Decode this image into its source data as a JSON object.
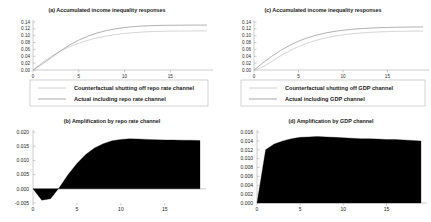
{
  "figure": {
    "background": "#ffffff",
    "line_color_counterfactual": "#d0d0d0",
    "line_color_actual": "#a8a8a8",
    "fill_color": "#000000"
  },
  "panels": {
    "a": {
      "title": "(a) Accumulated income inequality responses",
      "legend": {
        "counterfactual": "Counterfactual shutting off repo rate channel",
        "actual": "Actual including repo rate channel"
      }
    },
    "b": {
      "title": "(b) Amplification by repo rate channel"
    },
    "c": {
      "title": "(c) Accumulated income inequality responses",
      "legend": {
        "counterfactual": "Counterfactual shutting off GDP channel",
        "actual": "Actual including GDP channel"
      }
    },
    "d": {
      "title": "(d) Amplification by GDP channel"
    }
  },
  "chart_data": [
    {
      "id": "a",
      "type": "line",
      "title": "(a) Accumulated income inequality responses",
      "xlabel": "",
      "ylabel": "",
      "xlim": [
        0,
        19
      ],
      "ylim": [
        0.0,
        0.14
      ],
      "xticks": [
        0,
        5,
        10,
        15
      ],
      "yticks": [
        0.0,
        0.02,
        0.04,
        0.06,
        0.08,
        0.1,
        0.12,
        0.14
      ],
      "ytick_labels": [
        "0.00",
        "0.02",
        "0.04",
        "0.06",
        "0.08",
        "0.10",
        "0.12",
        "0.14"
      ],
      "grid": false,
      "legend_position": "below",
      "x": [
        0,
        1,
        2,
        3,
        4,
        5,
        6,
        7,
        8,
        9,
        10,
        11,
        12,
        13,
        14,
        15,
        16,
        17,
        18,
        19
      ],
      "series": [
        {
          "name": "Counterfactual shutting off repo rate channel",
          "color": "#d0d0d0",
          "values": [
            0.0,
            0.0215,
            0.04,
            0.0553,
            0.0679,
            0.0783,
            0.0867,
            0.0935,
            0.099,
            0.1033,
            0.1066,
            0.109,
            0.1108,
            0.112,
            0.1128,
            0.1133,
            0.1137,
            0.1139,
            0.1141,
            0.1142
          ]
        },
        {
          "name": "Actual including repo rate channel",
          "color": "#a8a8a8",
          "values": [
            0.0,
            0.0175,
            0.0365,
            0.0558,
            0.0729,
            0.0872,
            0.0988,
            0.1079,
            0.1149,
            0.1202,
            0.124,
            0.1266,
            0.1283,
            0.1294,
            0.1301,
            0.1305,
            0.1307,
            0.1309,
            0.131,
            0.1311
          ]
        }
      ]
    },
    {
      "id": "b",
      "type": "area",
      "title": "(b) Amplification by repo rate channel",
      "xlabel": "",
      "ylabel": "",
      "xlim": [
        0,
        19
      ],
      "ylim": [
        -0.005,
        0.02
      ],
      "xticks": [
        0,
        5,
        10,
        15
      ],
      "yticks": [
        -0.005,
        0.0,
        0.005,
        0.01,
        0.015,
        0.02
      ],
      "ytick_labels": [
        "-0.005",
        "0.000",
        "0.005",
        "0.010",
        "0.015",
        "0.020"
      ],
      "grid": false,
      "legend_position": "none",
      "baseline": 0.0,
      "x": [
        0,
        1,
        2,
        3,
        4,
        5,
        6,
        7,
        8,
        9,
        10,
        11,
        12,
        13,
        14,
        15,
        16,
        17,
        18,
        19
      ],
      "values": [
        0.0,
        -0.004,
        -0.0035,
        0.0005,
        0.005,
        0.0089,
        0.0121,
        0.0144,
        0.0159,
        0.0169,
        0.0174,
        0.0176,
        0.0175,
        0.0174,
        0.0173,
        0.0172,
        0.0172,
        0.0171,
        0.0171,
        0.017
      ]
    },
    {
      "id": "c",
      "type": "line",
      "title": "(c) Accumulated income inequality responses",
      "xlabel": "",
      "ylabel": "",
      "xlim": [
        0,
        19
      ],
      "ylim": [
        0.0,
        0.14
      ],
      "xticks": [
        0,
        5,
        10,
        15
      ],
      "yticks": [
        0.0,
        0.02,
        0.04,
        0.06,
        0.08,
        0.1,
        0.12,
        0.14
      ],
      "ytick_labels": [
        "0.00",
        "0.02",
        "0.04",
        "0.06",
        "0.08",
        "0.10",
        "0.12",
        "0.14"
      ],
      "grid": false,
      "legend_position": "below",
      "x": [
        0,
        1,
        2,
        3,
        4,
        5,
        6,
        7,
        8,
        9,
        10,
        11,
        12,
        13,
        14,
        15,
        16,
        17,
        18,
        19
      ],
      "series": [
        {
          "name": "Counterfactual shutting off GDP channel",
          "color": "#d0d0d0",
          "values": [
            0.0,
            0.009,
            0.025,
            0.0415,
            0.056,
            0.0683,
            0.0784,
            0.0866,
            0.0932,
            0.0984,
            0.1025,
            0.1056,
            0.108,
            0.1097,
            0.111,
            0.1119,
            0.1126,
            0.1131,
            0.1134,
            0.1137
          ]
        },
        {
          "name": "Actual including GDP channel",
          "color": "#a8a8a8",
          "values": [
            0.0,
            0.021,
            0.04,
            0.057,
            0.0718,
            0.084,
            0.0938,
            0.1016,
            0.1077,
            0.1124,
            0.116,
            0.1187,
            0.1207,
            0.1222,
            0.1233,
            0.1241,
            0.1247,
            0.1251,
            0.1254,
            0.1256
          ]
        }
      ]
    },
    {
      "id": "d",
      "type": "area",
      "title": "(d) Amplification by GDP channel",
      "xlabel": "",
      "ylabel": "",
      "xlim": [
        0,
        19
      ],
      "ylim": [
        0.0,
        0.016
      ],
      "xticks": [
        0,
        5,
        10,
        15
      ],
      "yticks": [
        0.0,
        0.002,
        0.004,
        0.006,
        0.008,
        0.01,
        0.012,
        0.014,
        0.016
      ],
      "ytick_labels": [
        "0.000",
        "0.002",
        "0.004",
        "0.006",
        "0.008",
        "0.010",
        "0.012",
        "0.014",
        "0.016"
      ],
      "grid": false,
      "legend_position": "none",
      "baseline": 0.0,
      "x": [
        0,
        1,
        2,
        3,
        4,
        5,
        6,
        7,
        8,
        9,
        10,
        11,
        12,
        13,
        14,
        15,
        16,
        17,
        18,
        19
      ],
      "values": [
        0.0,
        0.012,
        0.0133,
        0.014,
        0.0145,
        0.0148,
        0.0149,
        0.015,
        0.0149,
        0.0148,
        0.0147,
        0.0146,
        0.0145,
        0.0145,
        0.0144,
        0.0143,
        0.0143,
        0.0142,
        0.0141,
        0.014
      ]
    }
  ]
}
